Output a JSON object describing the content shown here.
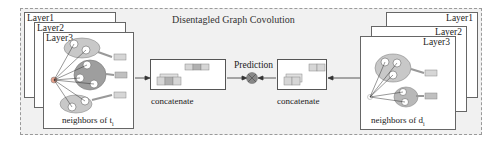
{
  "figure": {
    "title": "Disentagled Graph Covolution",
    "left_stack": {
      "layers": [
        "Layer1",
        "Layer2",
        "Layer3"
      ],
      "caption": "neighbors of t",
      "caption_sub": "i"
    },
    "right_stack": {
      "layers": [
        "Layer1",
        "Layer2",
        "Layer3"
      ],
      "caption": "neighbors of d",
      "caption_sub": "i"
    },
    "left_concat_label": "concatenate",
    "right_concat_label": "concatenate",
    "prediction_label": "Prediction",
    "colors": {
      "background": "#f1f1f1",
      "cluster_fill": "#c8c8c8",
      "cluster_dark": "#9e9e9e",
      "block_light": "#d6d6d6",
      "block_dark": "#b0b0b0",
      "operator": "#888888"
    }
  }
}
